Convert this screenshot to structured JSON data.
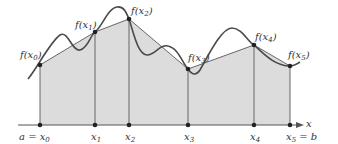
{
  "diagram": {
    "type": "trapezoidal-rule",
    "axis_label": "x",
    "points": [
      {
        "x": 40,
        "y": 65,
        "tick_label": "a = x",
        "tick_sub": "0",
        "f_label": "f(x",
        "f_sub": "0"
      },
      {
        "x": 95,
        "y": 32,
        "tick_label": "x",
        "tick_sub": "1",
        "f_label": "f(x",
        "f_sub": "1"
      },
      {
        "x": 129,
        "y": 19,
        "tick_label": "x",
        "tick_sub": "2",
        "f_label": "f(x",
        "f_sub": "2"
      },
      {
        "x": 188,
        "y": 69,
        "tick_label": "x",
        "tick_sub": "3",
        "f_label": "f(x",
        "f_sub": "3"
      },
      {
        "x": 254,
        "y": 45,
        "tick_label": "x",
        "tick_sub": "4",
        "f_label": "f(x",
        "f_sub": "4"
      },
      {
        "x": 290,
        "y": 66,
        "tick_label": "x",
        "tick_sub": "5",
        "tick_suffix": " = b",
        "f_label": "f(x",
        "f_sub": "5"
      }
    ],
    "colors": {
      "fill": "#d9d9d9",
      "stroke": "#555555",
      "curve": "#4a4a4a",
      "dot": "#222222"
    }
  }
}
